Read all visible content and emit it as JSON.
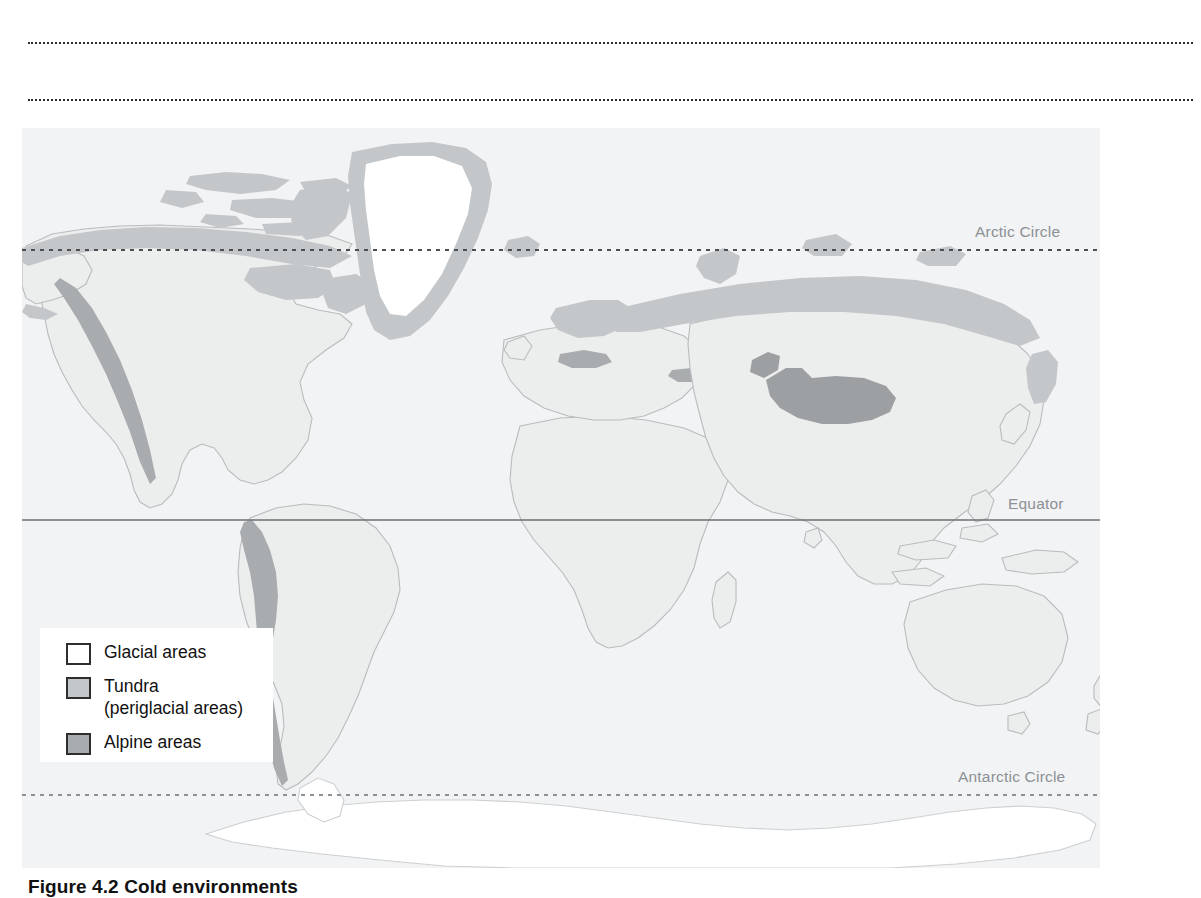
{
  "figure": {
    "caption": "Figure 4.2 Cold environments"
  },
  "rules": {
    "top_rule_1": "dotted-rule",
    "top_rule_2": "dotted-rule"
  },
  "map": {
    "latitude_labels": {
      "arctic_circle": "Arctic Circle",
      "equator": "Equator",
      "antarctic_circle": "Antarctic Circle"
    },
    "colors": {
      "ocean": "#f2f3f4",
      "land": "#eceded",
      "land_outline": "#b9bcbe",
      "glacial": "#ffffff",
      "tundra": "#c3c7ca",
      "alpine": "#a8acaf",
      "line": "#6b6f73",
      "label": "#8d9095"
    }
  },
  "legend": {
    "items": [
      {
        "label": "Glacial areas",
        "sub": "",
        "swatch": "#ffffff"
      },
      {
        "label": "Tundra",
        "sub": "(periglacial areas)",
        "swatch": "#c3c7ca"
      },
      {
        "label": "Alpine areas",
        "sub": "",
        "swatch": "#a8acaf"
      }
    ]
  }
}
